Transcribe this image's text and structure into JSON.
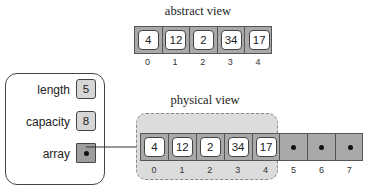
{
  "abstract_view": {
    "title": "abstract view",
    "values": [
      "4",
      "12",
      "2",
      "34",
      "17"
    ],
    "indices": [
      "0",
      "1",
      "2",
      "3",
      "4"
    ]
  },
  "struct": {
    "fields": [
      {
        "label": "length",
        "value": "5"
      },
      {
        "label": "capacity",
        "value": "8"
      },
      {
        "label": "array",
        "value": "pointer"
      }
    ]
  },
  "physical_view": {
    "title": "physical view",
    "values": [
      "4",
      "12",
      "2",
      "34",
      "17"
    ],
    "empty_slots": [
      "5",
      "6",
      "7"
    ],
    "indices": [
      "0",
      "1",
      "2",
      "3",
      "4",
      "5",
      "6",
      "7"
    ]
  },
  "colors": {
    "array_fill": "#a9a9a9",
    "region_fill": "#dcdcdc",
    "field_fill": "#d6d6d6",
    "pointer_fill": "#9e9e9e",
    "stroke": "#444444"
  }
}
